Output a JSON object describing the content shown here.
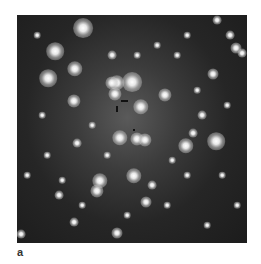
{
  "figure": {
    "panel_label": "a",
    "stars": [
      [
        66,
        13,
        9
      ],
      [
        38,
        36,
        8
      ],
      [
        31,
        63,
        8
      ],
      [
        58,
        54,
        7
      ],
      [
        100,
        68,
        7
      ],
      [
        115,
        67,
        9
      ],
      [
        95,
        68,
        6
      ],
      [
        124,
        92,
        7
      ],
      [
        98,
        79,
        6
      ],
      [
        103,
        123,
        7
      ],
      [
        120,
        124,
        6
      ],
      [
        128,
        125,
        6
      ],
      [
        169,
        131,
        7
      ],
      [
        199,
        126,
        8
      ],
      [
        57,
        86,
        6
      ],
      [
        148,
        80,
        6
      ],
      [
        117,
        161,
        7
      ],
      [
        83,
        166,
        7
      ],
      [
        80,
        176,
        6
      ],
      [
        219,
        33,
        5
      ],
      [
        196,
        59,
        5
      ],
      [
        213,
        20,
        4
      ],
      [
        225,
        38,
        4
      ],
      [
        200,
        5,
        4
      ],
      [
        129,
        187,
        5
      ],
      [
        57,
        207,
        4
      ],
      [
        100,
        218,
        5
      ],
      [
        4,
        219,
        4
      ],
      [
        42,
        180,
        4
      ],
      [
        185,
        100,
        4
      ],
      [
        176,
        118,
        4
      ],
      [
        95,
        40,
        4
      ],
      [
        60,
        128,
        4
      ],
      [
        135,
        170,
        4
      ],
      [
        150,
        190,
        3
      ],
      [
        190,
        210,
        3
      ],
      [
        30,
        140,
        3
      ],
      [
        160,
        40,
        3
      ],
      [
        140,
        30,
        3
      ],
      [
        20,
        20,
        3
      ],
      [
        180,
        75,
        3
      ],
      [
        210,
        90,
        3
      ],
      [
        75,
        110,
        3
      ],
      [
        110,
        200,
        3
      ],
      [
        170,
        160,
        3
      ],
      [
        220,
        190,
        3
      ],
      [
        45,
        165,
        3
      ],
      [
        155,
        145,
        3
      ],
      [
        90,
        140,
        3
      ],
      [
        25,
        100,
        3
      ],
      [
        205,
        160,
        3
      ],
      [
        65,
        190,
        3
      ],
      [
        120,
        40,
        3
      ],
      [
        170,
        20,
        3
      ],
      [
        10,
        160,
        3
      ]
    ],
    "markers": [
      {
        "x": 104,
        "y": 85,
        "w": 7,
        "h": 2
      },
      {
        "x": 99,
        "y": 91,
        "w": 2,
        "h": 6
      },
      {
        "x": 116,
        "y": 114,
        "w": 2,
        "h": 2
      }
    ]
  }
}
